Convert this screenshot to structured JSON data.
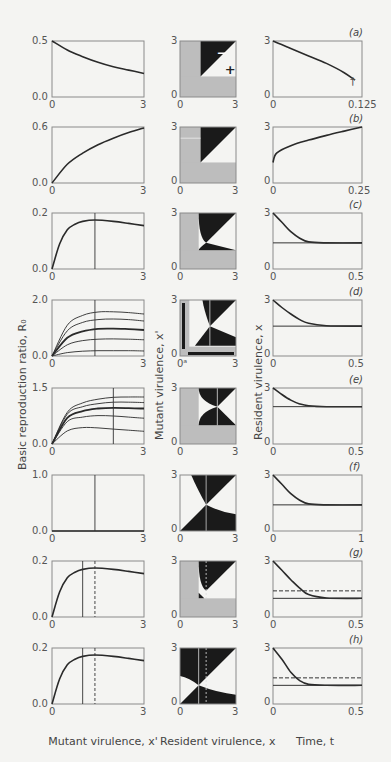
{
  "axis_labels": {
    "col1_y": "Basic reproduction ratio, R₀",
    "col1_x": "Mutant virulence, x'",
    "col2_y": "Mutant virulence, x'",
    "col2_x": "Resident virulence, x",
    "col3_y": "Resident virulence, x",
    "col3_x": "Time, t"
  },
  "panels": [
    {
      "tag": "(a)",
      "r0_ymax": "0.5",
      "r0_ymin": "0.0",
      "x0": "0",
      "x1": "3",
      "pip_lo": "0",
      "pip_hi": "3",
      "pip_x0": "0",
      "pip_x1": "3",
      "ts_y0": "0",
      "ts_y1": "3",
      "ts_x0": "0",
      "ts_x1": "0.125",
      "pip_minus": "−",
      "pip_plus": "+",
      "dagger": "†"
    },
    {
      "tag": "(b)",
      "r0_ymax": "0.6",
      "r0_ymin": "0.0",
      "x0": "0",
      "x1": "3",
      "pip_lo": "0",
      "pip_hi": "3",
      "pip_x0": "0",
      "pip_x1": "3",
      "ts_y0": "0",
      "ts_y1": "3",
      "ts_x0": "0",
      "ts_x1": "0.25"
    },
    {
      "tag": "(c)",
      "r0_ymax": "0.2",
      "r0_ymin": "0.0",
      "x0": "0",
      "x1": "3",
      "pip_lo": "0",
      "pip_hi": "3",
      "pip_x0": "0",
      "pip_x1": "3",
      "ts_y0": "0",
      "ts_y1": "3",
      "ts_x0": "0",
      "ts_x1": "0.5"
    },
    {
      "tag": "(d)",
      "r0_ymax": "2.0",
      "r0_ymin": "0.0",
      "x0": "0",
      "x1": "3",
      "pip_lo": "0",
      "pip_hi": "3",
      "pip_x0": "0ᵃ",
      "pip_x1": "3",
      "ts_y0": "0",
      "ts_y1": "3",
      "ts_x0": "0",
      "ts_x1": "0.5"
    },
    {
      "tag": "(e)",
      "r0_ymax": "1.5",
      "r0_ymin": "0.0",
      "x0": "0",
      "x1": "3",
      "pip_lo": "0",
      "pip_hi": "3",
      "pip_x0": "0",
      "pip_x1": "3",
      "ts_y0": "0",
      "ts_y1": "3",
      "ts_x0": "0",
      "ts_x1": "0.5"
    },
    {
      "tag": "(f)",
      "r0_ymax": "1.0",
      "r0_ymin": "0.0",
      "x0": "0",
      "x1": "3",
      "pip_lo": "0",
      "pip_hi": "3",
      "pip_x0": "0",
      "pip_x1": "3",
      "ts_y0": "0",
      "ts_y1": "3",
      "ts_x0": "0",
      "ts_x1": "1"
    },
    {
      "tag": "(g)",
      "r0_ymax": "0.2",
      "r0_ymin": "0.0",
      "x0": "0",
      "x1": "3",
      "pip_lo": "0",
      "pip_hi": "3",
      "pip_x0": "0",
      "pip_x1": "3",
      "ts_y0": "0",
      "ts_y1": "3",
      "ts_x0": "0",
      "ts_x1": "0.5"
    },
    {
      "tag": "(h)",
      "r0_ymax": "0.2",
      "r0_ymin": "0.0",
      "x0": "0",
      "x1": "3",
      "pip_lo": "0",
      "pip_hi": "3",
      "pip_x0": "0",
      "pip_x1": "3",
      "ts_y0": "0",
      "ts_y1": "3",
      "ts_x0": "0",
      "ts_x1": "0.5"
    }
  ],
  "colors": {
    "curve": "#2a2a2a",
    "pip_gray": "#bdbdbd",
    "pip_black": "#1a1a1a",
    "axis": "#8a8a8a",
    "bg": "#f4f4f2"
  },
  "chart_data": [
    {
      "panel": "a",
      "type": "line",
      "xlabel": "Mutant virulence, x'",
      "ylabel": "Basic reproduction ratio, R0",
      "xlim": [
        0,
        3
      ],
      "ylim": [
        0,
        0.5
      ],
      "x": [
        0,
        0.5,
        1,
        1.5,
        2,
        2.5,
        3
      ],
      "values": [
        0.5,
        0.42,
        0.36,
        0.31,
        0.27,
        0.24,
        0.21
      ]
    },
    {
      "panel": "a",
      "type": "heatmap",
      "title": "PIP",
      "xlabel": "Resident virulence, x",
      "ylabel": "Mutant virulence, x'",
      "xlim": [
        0,
        3
      ],
      "ylim": [
        0,
        3
      ],
      "annotations": [
        "−",
        "+"
      ],
      "gray_threshold": 1.1
    },
    {
      "panel": "a",
      "type": "line",
      "xlabel": "Time, t",
      "ylabel": "Resident virulence, x",
      "xlim": [
        0,
        0.125
      ],
      "ylim": [
        0,
        3
      ],
      "x": [
        0,
        0.025,
        0.05,
        0.075,
        0.1,
        0.115
      ],
      "values": [
        3.0,
        2.6,
        2.2,
        1.8,
        1.3,
        0.9
      ],
      "annotations": [
        "†"
      ]
    },
    {
      "panel": "b",
      "type": "line",
      "xlim": [
        0,
        3
      ],
      "ylim": [
        0,
        0.6
      ],
      "x": [
        0,
        0.5,
        1,
        1.5,
        2,
        2.5,
        3
      ],
      "values": [
        0,
        0.2,
        0.32,
        0.41,
        0.48,
        0.54,
        0.59
      ]
    },
    {
      "panel": "b",
      "type": "heatmap",
      "title": "PIP",
      "xlim": [
        0,
        3
      ],
      "ylim": [
        0,
        3
      ],
      "gray_threshold": 1.1
    },
    {
      "panel": "b",
      "type": "line",
      "xlim": [
        0,
        0.25
      ],
      "ylim": [
        0,
        3
      ],
      "x": [
        0,
        0.01,
        0.05,
        0.1,
        0.15,
        0.2,
        0.25
      ],
      "values": [
        1.1,
        1.6,
        2.0,
        2.3,
        2.55,
        2.78,
        3.0
      ]
    },
    {
      "panel": "c",
      "type": "line",
      "xlim": [
        0,
        3
      ],
      "ylim": [
        0,
        0.2
      ],
      "vline": 1.4,
      "x": [
        0,
        0.25,
        0.5,
        0.75,
        1,
        1.4,
        2,
        2.5,
        3
      ],
      "values": [
        0,
        0.09,
        0.14,
        0.16,
        0.17,
        0.175,
        0.17,
        0.163,
        0.155
      ]
    },
    {
      "panel": "c",
      "type": "heatmap",
      "title": "PIP",
      "xlim": [
        0,
        3
      ],
      "ylim": [
        0,
        3
      ],
      "gray_threshold": 1.0,
      "singular_point": 1.4
    },
    {
      "panel": "c",
      "type": "line",
      "xlim": [
        0,
        0.5
      ],
      "ylim": [
        0,
        3
      ],
      "hline": 1.4,
      "x": [
        0,
        0.05,
        0.1,
        0.15,
        0.2,
        0.3,
        0.5
      ],
      "values": [
        3.0,
        2.5,
        2.0,
        1.65,
        1.45,
        1.4,
        1.4
      ]
    },
    {
      "panel": "d",
      "type": "line",
      "xlim": [
        0,
        3
      ],
      "ylim": [
        0,
        2.0
      ],
      "vline": 1.4,
      "series": [
        {
          "name": "curve1",
          "values": [
            0,
            1.1,
            1.45,
            1.57,
            1.58,
            1.55,
            1.5
          ]
        },
        {
          "name": "curve2",
          "values": [
            0,
            0.9,
            1.2,
            1.3,
            1.32,
            1.3,
            1.25
          ]
        },
        {
          "name": "curve3 (bold)",
          "values": [
            0,
            0.65,
            0.88,
            0.97,
            0.98,
            0.96,
            0.93
          ]
        },
        {
          "name": "curve4",
          "values": [
            0,
            0.4,
            0.55,
            0.6,
            0.61,
            0.6,
            0.58
          ]
        },
        {
          "name": "curve5",
          "values": [
            0,
            0.12,
            0.17,
            0.19,
            0.19,
            0.19,
            0.18
          ]
        }
      ],
      "x": [
        0,
        0.5,
        1,
        1.5,
        2,
        2.5,
        3
      ]
    },
    {
      "panel": "d",
      "type": "heatmap",
      "title": "PIP",
      "xlim": [
        0,
        3
      ],
      "ylim": [
        0,
        3
      ],
      "gray_threshold": 0.2,
      "singular_point": 1.6
    },
    {
      "panel": "d",
      "type": "line",
      "xlim": [
        0,
        0.5
      ],
      "ylim": [
        0,
        3
      ],
      "hline": 1.6,
      "x": [
        0,
        0.05,
        0.1,
        0.15,
        0.2,
        0.3,
        0.5
      ],
      "values": [
        3.0,
        2.6,
        2.25,
        1.95,
        1.75,
        1.62,
        1.6
      ]
    },
    {
      "panel": "e",
      "type": "line",
      "xlim": [
        0,
        3
      ],
      "ylim": [
        0,
        1.5
      ],
      "vline": 2.0,
      "series": [
        {
          "name": "curve1",
          "values": [
            0,
            0.85,
            1.1,
            1.2,
            1.25,
            1.26,
            1.26
          ]
        },
        {
          "name": "curve2",
          "values": [
            0,
            0.8,
            1.0,
            1.08,
            1.12,
            1.12,
            1.11
          ]
        },
        {
          "name": "curve3 (bold)",
          "values": [
            0,
            0.7,
            0.88,
            0.95,
            0.97,
            0.96,
            0.95
          ]
        },
        {
          "name": "curve4",
          "values": [
            0,
            0.6,
            0.72,
            0.76,
            0.75,
            0.72,
            0.69
          ]
        },
        {
          "name": "curve5",
          "values": [
            0,
            0.35,
            0.44,
            0.43,
            0.4,
            0.37,
            0.34
          ]
        }
      ],
      "x": [
        0,
        0.5,
        1,
        1.5,
        2,
        2.5,
        3
      ]
    },
    {
      "panel": "e",
      "type": "heatmap",
      "title": "PIP",
      "xlim": [
        0,
        3
      ],
      "ylim": [
        0,
        3
      ],
      "gray_threshold": 1.0,
      "singular_point": 2.0
    },
    {
      "panel": "e",
      "type": "line",
      "xlim": [
        0,
        0.5
      ],
      "ylim": [
        0,
        3
      ],
      "hline": 2.0,
      "x": [
        0,
        0.05,
        0.1,
        0.15,
        0.2,
        0.3,
        0.5
      ],
      "values": [
        3.0,
        2.65,
        2.35,
        2.15,
        2.05,
        2.0,
        2.0
      ]
    },
    {
      "panel": "f",
      "type": "line",
      "xlim": [
        0,
        3
      ],
      "ylim": [
        0,
        1.0
      ],
      "vline": 1.4,
      "x": [
        0,
        3
      ],
      "values": [
        0,
        0
      ]
    },
    {
      "panel": "f",
      "type": "heatmap",
      "title": "PIP",
      "xlim": [
        0,
        3
      ],
      "ylim": [
        0,
        3
      ],
      "singular_point": 1.4
    },
    {
      "panel": "f",
      "type": "line",
      "xlim": [
        0,
        1
      ],
      "ylim": [
        0,
        3
      ],
      "hline": 1.4,
      "x": [
        0,
        0.1,
        0.2,
        0.3,
        0.4,
        0.6,
        1
      ],
      "values": [
        3.0,
        2.5,
        2.0,
        1.65,
        1.45,
        1.4,
        1.4
      ]
    },
    {
      "panel": "g",
      "type": "line",
      "xlim": [
        0,
        3
      ],
      "ylim": [
        0,
        0.2
      ],
      "vline": 1.0,
      "vline_dashed": 1.4,
      "x": [
        0,
        0.25,
        0.5,
        0.75,
        1,
        1.4,
        2,
        2.5,
        3
      ],
      "values": [
        0,
        0.09,
        0.14,
        0.16,
        0.17,
        0.175,
        0.17,
        0.163,
        0.155
      ]
    },
    {
      "panel": "g",
      "type": "heatmap",
      "title": "PIP",
      "xlim": [
        0,
        3
      ],
      "ylim": [
        0,
        3
      ],
      "gray_threshold": 1.0,
      "vline": 1.0,
      "vline_dashed": 1.4
    },
    {
      "panel": "g",
      "type": "line",
      "xlim": [
        0,
        0.5
      ],
      "ylim": [
        0,
        3
      ],
      "hline": 1.0,
      "hline_dashed": 1.4,
      "x": [
        0,
        0.05,
        0.1,
        0.15,
        0.2,
        0.3,
        0.5
      ],
      "values": [
        3.0,
        2.5,
        2.0,
        1.55,
        1.2,
        1.02,
        1.0
      ]
    },
    {
      "panel": "h",
      "type": "line",
      "xlim": [
        0,
        3
      ],
      "ylim": [
        0,
        0.2
      ],
      "vline": 1.0,
      "vline_dashed": 1.4,
      "x": [
        0,
        0.25,
        0.5,
        0.75,
        1,
        1.4,
        2,
        2.5,
        3
      ],
      "values": [
        0,
        0.09,
        0.14,
        0.16,
        0.17,
        0.175,
        0.17,
        0.163,
        0.155
      ]
    },
    {
      "panel": "h",
      "type": "heatmap",
      "title": "PIP",
      "xlim": [
        0,
        3
      ],
      "ylim": [
        0,
        3
      ],
      "singular_point": 1.0,
      "vline": 1.0,
      "vline_dashed": 1.4
    },
    {
      "panel": "h",
      "type": "line",
      "xlim": [
        0,
        0.5
      ],
      "ylim": [
        0,
        3
      ],
      "hline": 1.0,
      "hline_dashed": 1.4,
      "x": [
        0,
        0.05,
        0.1,
        0.15,
        0.2,
        0.3,
        0.5
      ],
      "values": [
        3.0,
        2.4,
        1.7,
        1.25,
        1.05,
        1.0,
        1.0
      ]
    }
  ]
}
